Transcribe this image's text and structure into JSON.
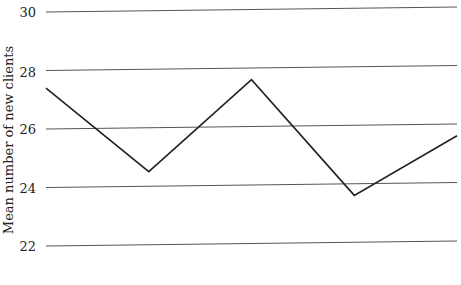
{
  "chart_data": {
    "type": "line",
    "title": "",
    "xlabel": "",
    "ylabel": "Mean number of new clients",
    "ylim": [
      22,
      30
    ],
    "y_ticks": [
      30,
      28,
      26,
      24,
      22
    ],
    "grid": true,
    "legend": null,
    "x": [
      1,
      2,
      3,
      4,
      5
    ],
    "series": [
      {
        "name": "Mean number of new clients",
        "values": [
          27.4,
          24.5,
          27.6,
          23.6,
          25.6
        ]
      }
    ],
    "colors": {
      "line": "#222222",
      "grid": "#555555",
      "text": "#222222"
    }
  },
  "axis": {
    "ylabel": "Mean number of new clients",
    "ticks": [
      {
        "label": "30"
      },
      {
        "label": "28"
      },
      {
        "label": "26"
      },
      {
        "label": "24"
      },
      {
        "label": "22"
      }
    ]
  }
}
